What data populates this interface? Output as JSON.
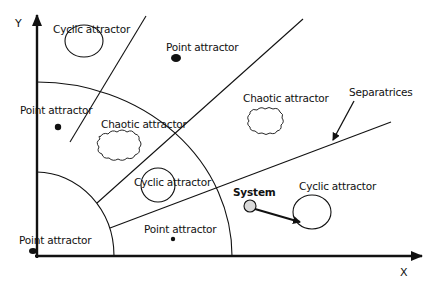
{
  "diagram": {
    "axes": {
      "x_label": "X",
      "y_label": "Y"
    },
    "labels": {
      "cyclic_top_left": "Cyclic attractor",
      "point_top": "Point attractor",
      "point_left": "Point attractor",
      "chaotic_middle": "Chaotic attractor",
      "chaotic_right": "Chaotic attractor",
      "separatrices": "Separatrices",
      "cyclic_center": "Cyclic attractor",
      "system": "System",
      "cyclic_right": "Cyclic attractor",
      "point_bottom": "Point attractor",
      "point_origin": "Point attractor"
    },
    "colors": {
      "stroke": "#111111",
      "system_fill": "#d9d9d9",
      "background": "#ffffff"
    }
  }
}
